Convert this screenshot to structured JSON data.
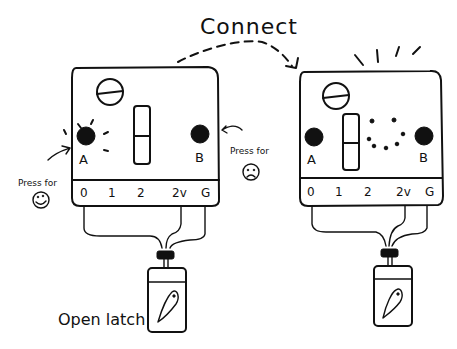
{
  "diagram": {
    "title": "Connect",
    "left_device": {
      "button_a": "A",
      "button_b": "B",
      "press_for_left": "Press for",
      "press_for_right": "Press for",
      "happy_face": "☺",
      "sad_face": "☹",
      "pins": [
        "0",
        "1",
        "2",
        "2v",
        "G"
      ]
    },
    "right_device": {
      "button_a": "A",
      "button_b": "B",
      "pins": [
        "0",
        "1",
        "2",
        "2v",
        "G"
      ]
    },
    "latch_label": "Open latch"
  }
}
